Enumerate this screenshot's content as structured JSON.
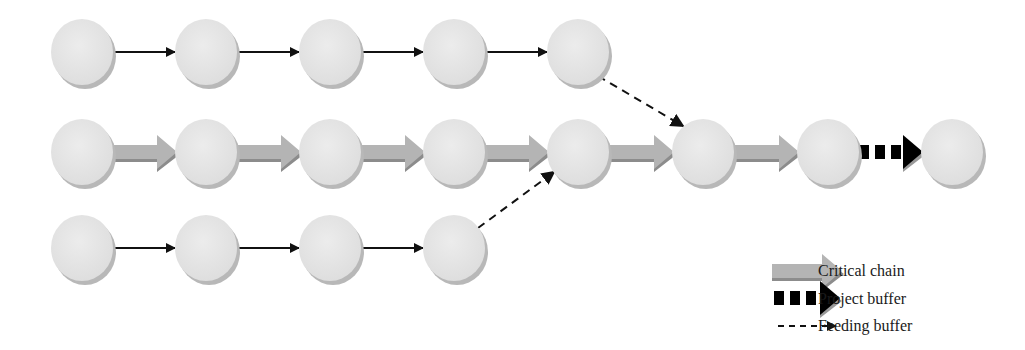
{
  "diagram": {
    "node_radius": 31,
    "node_color": "#e6e6e6",
    "node_shadow": "#b8b8b8",
    "rows": [
      {
        "name": "feeding-chain-top",
        "y": 52,
        "nodes": [
          82,
          206,
          330,
          454,
          578
        ]
      },
      {
        "name": "critical-chain",
        "y": 152,
        "nodes": [
          82,
          206,
          330,
          454,
          578,
          703,
          828,
          952
        ]
      },
      {
        "name": "feeding-chain-bottom",
        "y": 248,
        "nodes": [
          82,
          206,
          330,
          454
        ]
      }
    ],
    "edges": {
      "thin_arrow_color": "#111111",
      "critical_arrow_color": "#b4b4b4",
      "critical_arrow_shadow": "#8c8c8c",
      "buffer_arrow_color": "#000000"
    }
  },
  "legend": {
    "items": [
      {
        "key": "critical-chain",
        "label": "Critical chain"
      },
      {
        "key": "project-buffer",
        "label": "Project buffer"
      },
      {
        "key": "feeding-buffer",
        "label": "Feeding buffer"
      }
    ]
  }
}
